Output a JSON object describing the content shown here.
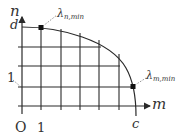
{
  "diagram": {
    "y_axis_label": "n",
    "x_axis_label": "m",
    "y_top_label": "d",
    "x_end_label": "c",
    "origin_label": "O",
    "x_tick_label": "1",
    "y_tick_label": "1",
    "point_top": {
      "symbol": "λ",
      "subscript": "n,min"
    },
    "point_right": {
      "symbol": "λ",
      "subscript": "m,min"
    }
  },
  "colors": {
    "line": "#2a2a2a",
    "text": "#333333",
    "leader": "#777777"
  }
}
